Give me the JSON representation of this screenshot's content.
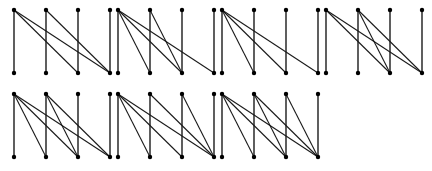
{
  "diagram": {
    "colors": {
      "edge": "#1a1a1a",
      "node": "#000000",
      "background": "#ffffff"
    },
    "rows_y": [
      {
        "top": 10,
        "bottom": 73
      },
      {
        "top": 94,
        "bottom": 157
      }
    ],
    "graphs": [
      {
        "id": 1,
        "row": 0,
        "x": [
          14,
          46,
          78,
          110
        ],
        "diagonals": [
          [
            0,
            2
          ],
          [
            0,
            3
          ],
          [
            1,
            3
          ]
        ]
      },
      {
        "id": 2,
        "row": 0,
        "x": [
          118,
          150,
          182,
          214
        ],
        "diagonals": [
          [
            0,
            1
          ],
          [
            0,
            2
          ],
          [
            0,
            3
          ],
          [
            1,
            2
          ]
        ]
      },
      {
        "id": 3,
        "row": 0,
        "x": [
          222,
          254,
          286,
          318
        ],
        "diagonals": [
          [
            0,
            1
          ],
          [
            0,
            2
          ],
          [
            0,
            3
          ]
        ]
      },
      {
        "id": 4,
        "row": 0,
        "x": [
          326,
          358,
          390,
          422
        ],
        "diagonals": [
          [
            0,
            2
          ],
          [
            0,
            3
          ],
          [
            1,
            2
          ],
          [
            1,
            3
          ]
        ]
      },
      {
        "id": 5,
        "row": 1,
        "x": [
          14,
          46,
          78,
          110
        ],
        "diagonals": [
          [
            0,
            1
          ],
          [
            0,
            2
          ],
          [
            0,
            3
          ],
          [
            1,
            2
          ],
          [
            1,
            3
          ]
        ]
      },
      {
        "id": 6,
        "row": 1,
        "x": [
          118,
          150,
          182,
          214
        ],
        "diagonals": [
          [
            0,
            1
          ],
          [
            0,
            2
          ],
          [
            0,
            3
          ],
          [
            1,
            3
          ],
          [
            2,
            3
          ]
        ]
      },
      {
        "id": 7,
        "row": 1,
        "x": [
          222,
          254,
          286,
          318
        ],
        "diagonals": [
          [
            0,
            1
          ],
          [
            0,
            2
          ],
          [
            0,
            3
          ],
          [
            1,
            2
          ],
          [
            1,
            3
          ],
          [
            2,
            3
          ]
        ]
      }
    ]
  }
}
